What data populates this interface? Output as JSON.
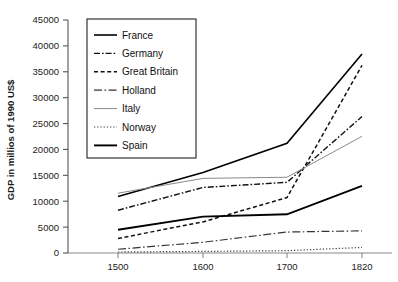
{
  "chart_data": {
    "type": "line",
    "title": "",
    "xlabel": "",
    "ylabel": "GDP in millios of 1990 US$",
    "x": [
      1500,
      1600,
      1700,
      1820
    ],
    "xtick_labels": [
      "1500",
      "1600",
      "1700",
      "1820"
    ],
    "ytick_labels": [
      "0",
      "5000",
      "10000",
      "15000",
      "20000",
      "25000",
      "30000",
      "35000",
      "40000",
      "45000"
    ],
    "ylim": [
      0,
      45000
    ],
    "ytick_step": 5000,
    "grid": false,
    "legend_position": "upper-left-inside",
    "series": [
      {
        "name": "France",
        "style": "solid",
        "width": 1.6,
        "color": "#000000",
        "values": [
          10912,
          15559,
          21180,
          38434
        ]
      },
      {
        "name": "Germany",
        "style": "dash-dot",
        "width": 1.4,
        "color": "#111111",
        "values": [
          8256,
          12656,
          13650,
          26349
        ]
      },
      {
        "name": "Great Britain",
        "style": "dashed",
        "width": 1.5,
        "color": "#111111",
        "values": [
          2815,
          6007,
          10709,
          36232
        ]
      },
      {
        "name": "Holland",
        "style": "long-dash-dot",
        "width": 1.2,
        "color": "#333333",
        "values": [
          723,
          2072,
          4047,
          4288
        ]
      },
      {
        "name": "Italy",
        "style": "thin-solid",
        "width": 1.0,
        "color": "#8a8a8a",
        "values": [
          11550,
          14410,
          14630,
          22535
        ]
      },
      {
        "name": "Norway",
        "style": "dotted",
        "width": 1.2,
        "color": "#444444",
        "values": [
          192,
          304,
          450,
          1071
        ]
      },
      {
        "name": "Spain",
        "style": "thick-solid",
        "width": 1.9,
        "color": "#000000",
        "values": [
          4495,
          7029,
          7481,
          12975
        ]
      }
    ]
  },
  "legend": {
    "items": [
      {
        "label": "France"
      },
      {
        "label": "Germany"
      },
      {
        "label": "Great Britain"
      },
      {
        "label": "Holland"
      },
      {
        "label": "Italy"
      },
      {
        "label": "Norway"
      },
      {
        "label": "Spain"
      }
    ]
  }
}
